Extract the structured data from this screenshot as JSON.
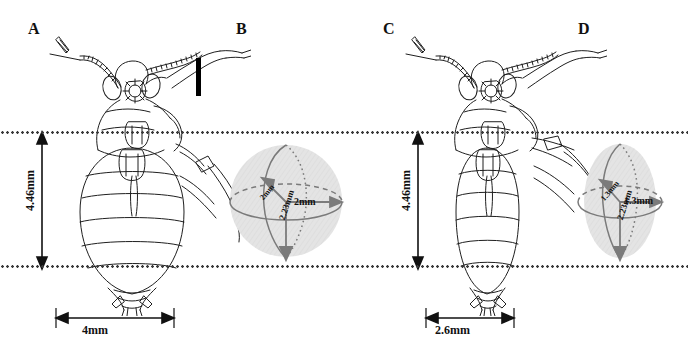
{
  "figure": {
    "type": "scientific-line-art-figure",
    "background_color": "#ffffff",
    "ink_color": "#1a1a1a",
    "guide_line_color": "#3a3a3a",
    "sphere_fill_color": "#e3e3e3",
    "sphere_stroke_color": "#6e6e6e"
  },
  "guides": {
    "upper_label": "upper-reference-line",
    "lower_label": "lower-reference-line"
  },
  "panels": [
    {
      "id": "A",
      "letter": "A",
      "kind": "louse-drawing",
      "subject": "broad-bodied louse, dorsal view",
      "has_scale_bar": true,
      "measurements": {
        "vertical": "4.46mm",
        "horizontal": "4mm"
      }
    },
    {
      "id": "B",
      "letter": "B",
      "kind": "ellipsoid-diagram",
      "subject": "sphere approximating panel A body volume",
      "has_scale_bar": false,
      "measurements": {
        "radius_horizontal": "2mm",
        "radius_diagonal": "2mm",
        "radius_vertical": "2.23mm"
      }
    },
    {
      "id": "C",
      "letter": "C",
      "kind": "louse-drawing",
      "subject": "narrow-bodied louse, dorsal view",
      "has_scale_bar": false,
      "measurements": {
        "vertical": "4.46mm",
        "horizontal": "2.6mm"
      }
    },
    {
      "id": "D",
      "letter": "D",
      "kind": "ellipsoid-diagram",
      "subject": "prolate ellipsoid approximating panel C body volume",
      "has_scale_bar": false,
      "measurements": {
        "radius_horizontal": "1.3mm",
        "radius_diagonal": "1.3mm",
        "radius_vertical": "2.23mm"
      }
    }
  ],
  "labels": {
    "a_vertical": "4.46mm",
    "a_horizontal": "4mm",
    "b_horizontal": "2mm",
    "b_diagonal": "2mm",
    "b_vertical": "2.23mm",
    "c_vertical": "4.46mm",
    "c_horizontal": "2.6mm",
    "d_horizontal": "1.3mm",
    "d_diagonal": "1.3mm",
    "d_vertical": "2.23mm"
  }
}
